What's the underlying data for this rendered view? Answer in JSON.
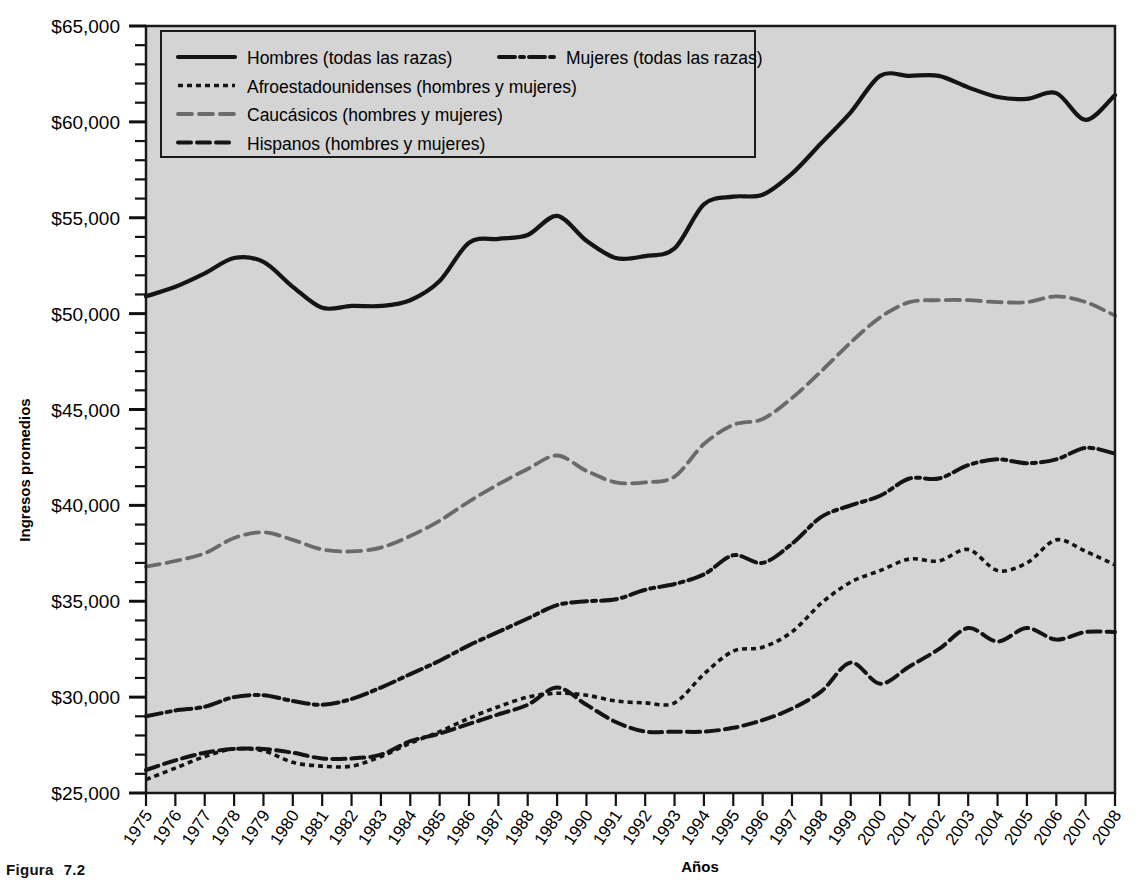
{
  "figure": {
    "caption_label": "Figura",
    "caption_number": "7.2"
  },
  "axes": {
    "ylabel": "Ingresos promedios",
    "xlabel": "Años",
    "y_ticks": [
      "$25,000",
      "$30,000",
      "$35,000",
      "$40,000",
      "$45,000",
      "$50,000",
      "$55,000",
      "$60,000",
      "$65,000"
    ],
    "y_min": 25000,
    "y_max": 65000,
    "y_step": 5000,
    "y_minor_step": 1000,
    "plot_bg": "#d4d4d4",
    "frame_color": "#1a1a1a"
  },
  "legend": {
    "entries": [
      {
        "label": "Hombres (todas las razas)",
        "style": "solid",
        "color": "#111111"
      },
      {
        "label": "Mujeres (todas las razas)",
        "style": "dashdot",
        "color": "#111111"
      },
      {
        "label": "Afroestadounidenses (hombres y mujeres)",
        "style": "dotted",
        "color": "#111111"
      },
      {
        "label": "Caucásicos (hombres y mujeres)",
        "style": "dashed-gray",
        "color": "#666666"
      },
      {
        "label": "Hispanos (hombres y mujeres)",
        "style": "dashed",
        "color": "#111111"
      }
    ]
  },
  "chart_data": {
    "type": "line",
    "title": "",
    "xlabel": "Años",
    "ylabel": "Ingresos promedios",
    "ylim": [
      25000,
      65000
    ],
    "grid": false,
    "legend_position": "top-left",
    "categories": [
      "1975",
      "1976",
      "1977",
      "1978",
      "1979",
      "1980",
      "1981",
      "1982",
      "1983",
      "1984",
      "1985",
      "1986",
      "1987",
      "1988",
      "1989",
      "1990",
      "1991",
      "1992",
      "1993",
      "1994",
      "1995",
      "1996",
      "1997",
      "1998",
      "1999",
      "2000",
      "2001",
      "2002",
      "2003",
      "2004",
      "2005",
      "2006",
      "2007",
      "2008"
    ],
    "series": [
      {
        "name": "Hombres (todas las razas)",
        "style": "solid",
        "values": [
          50900,
          51400,
          52100,
          52900,
          52700,
          51400,
          50300,
          50400,
          50400,
          50700,
          51700,
          53700,
          53900,
          54100,
          55100,
          53800,
          52900,
          53000,
          53400,
          55700,
          56100,
          56200,
          57300,
          58900,
          60500,
          62400,
          62400,
          62400,
          61800,
          61300,
          61200,
          61500,
          60100,
          61400
        ]
      },
      {
        "name": "Mujeres (todas las razas)",
        "style": "dashdot",
        "values": [
          29000,
          29300,
          29500,
          30000,
          30100,
          29800,
          29600,
          29900,
          30500,
          31200,
          31900,
          32700,
          33400,
          34100,
          34800,
          35000,
          35100,
          35600,
          35900,
          36400,
          37400,
          37000,
          38000,
          39400,
          40000,
          40500,
          41400,
          41400,
          42100,
          42400,
          42200,
          42400,
          43000,
          42700
        ]
      },
      {
        "name": "Afroestadounidenses (hombres y mujeres)",
        "style": "dotted",
        "values": [
          25700,
          26300,
          26900,
          27300,
          27200,
          26600,
          26400,
          26400,
          26900,
          27600,
          28200,
          28900,
          29500,
          30000,
          30200,
          30100,
          29800,
          29700,
          29700,
          31200,
          32400,
          32600,
          33400,
          34900,
          36000,
          36600,
          37200,
          37100,
          37700,
          36600,
          37000,
          38200,
          37600,
          36900
        ]
      },
      {
        "name": "Caucásicos (hombres y mujeres)",
        "style": "dashed-gray",
        "values": [
          36800,
          37100,
          37500,
          38300,
          38600,
          38200,
          37700,
          37600,
          37800,
          38400,
          39200,
          40200,
          41100,
          41900,
          42600,
          41800,
          41200,
          41200,
          41500,
          43200,
          44200,
          44500,
          45600,
          47000,
          48500,
          49800,
          50600,
          50700,
          50700,
          50600,
          50600,
          50900,
          50600,
          49900
        ]
      },
      {
        "name": "Hispanos (hombres y mujeres)",
        "style": "dashed",
        "values": [
          26200,
          26700,
          27100,
          27300,
          27300,
          27100,
          26800,
          26800,
          27000,
          27700,
          28100,
          28600,
          29100,
          29600,
          30500,
          29600,
          28700,
          28200,
          28200,
          28200,
          28400,
          28800,
          29400,
          30300,
          31800,
          30700,
          31600,
          32500,
          33600,
          32900,
          33600,
          33000,
          33400,
          33400
        ]
      }
    ]
  }
}
